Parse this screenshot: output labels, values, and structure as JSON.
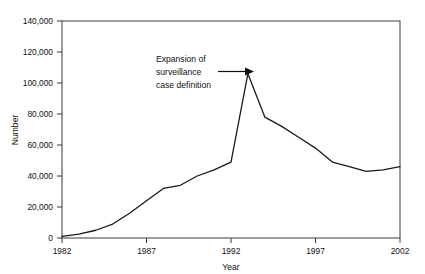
{
  "chart_data": {
    "type": "line",
    "title": "",
    "xlabel": "Year",
    "ylabel": "Number",
    "xlim": [
      1982,
      2002
    ],
    "ylim": [
      0,
      140000
    ],
    "grid": false,
    "legend": null,
    "x_ticks": [
      1982,
      1987,
      1992,
      1997,
      2002
    ],
    "x_tick_labels": [
      "1982",
      "1987",
      "1992",
      "1997",
      "2002"
    ],
    "y_ticks": [
      0,
      20000,
      40000,
      60000,
      80000,
      100000,
      120000,
      140000
    ],
    "y_tick_labels": [
      "0",
      "20,000",
      "40,000",
      "60,000",
      "80,000",
      "100,000",
      "120,000",
      "140,000"
    ],
    "x": [
      1982,
      1983,
      1984,
      1985,
      1986,
      1987,
      1988,
      1989,
      1990,
      1991,
      1992,
      1993,
      1994,
      1995,
      1996,
      1997,
      1998,
      1999,
      2000,
      2001,
      2002
    ],
    "values": [
      1000,
      2500,
      5000,
      9000,
      16000,
      24000,
      32000,
      34000,
      40000,
      44000,
      49000,
      106000,
      78000,
      72000,
      65000,
      58000,
      49000,
      46000,
      43000,
      44000,
      46000
    ],
    "series": [
      {
        "name": "Number",
        "values": [
          1000,
          2500,
          5000,
          9000,
          16000,
          24000,
          32000,
          34000,
          40000,
          44000,
          49000,
          106000,
          78000,
          72000,
          65000,
          58000,
          49000,
          46000,
          43000,
          44000,
          46000
        ]
      }
    ],
    "annotations": [
      {
        "text_lines": [
          "Expansion of",
          "surveillance",
          "case definition"
        ],
        "arrow": "right",
        "points_to_x": 1993,
        "points_to_y": 106000
      }
    ]
  },
  "axis": {
    "ylabel": "Number",
    "xlabel": "Year"
  },
  "annotation": {
    "line1": "Expansion of",
    "line2": "surveillance",
    "line3": "case definition"
  },
  "y_labels": {
    "t0": "0",
    "t1": "20,000",
    "t2": "40,000",
    "t3": "60,000",
    "t4": "80,000",
    "t5": "100,000",
    "t6": "120,000",
    "t7": "140,000"
  },
  "x_labels": {
    "t0": "1982",
    "t1": "1987",
    "t2": "1992",
    "t3": "1997",
    "t4": "2002"
  },
  "colors": {
    "line": "#1a1a1a",
    "frame": "#3a3a3a",
    "background": "#ffffff"
  }
}
